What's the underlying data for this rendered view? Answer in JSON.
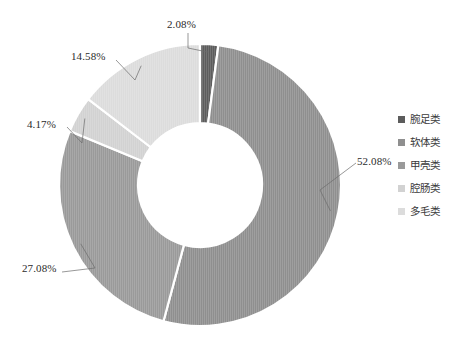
{
  "chart_data": {
    "type": "pie",
    "variant": "donut",
    "title": "",
    "subtitle": "",
    "xlabel": "",
    "ylabel": "",
    "legend_position": "right",
    "grid": false,
    "units": "%",
    "start_angle_deg": 0,
    "direction": "clockwise",
    "inner_radius_ratio": 0.44,
    "categories": [
      "腕足类",
      "软体类",
      "甲壳类",
      "腔肠类",
      "多毛类"
    ],
    "values": [
      2.08,
      52.08,
      27.08,
      4.17,
      14.58
    ],
    "data_labels": [
      "2.08%",
      "52.08%",
      "27.08%",
      "4.17%",
      "14.58%"
    ],
    "colors": [
      "#5c5c5c",
      "#8f8f8f",
      "#9a9a9a",
      "#d2d2d2",
      "#dcdcdc"
    ],
    "slices": [
      {
        "label": "腕足类",
        "value": 2.08,
        "data_label": "2.08%",
        "color": "#5c5c5c"
      },
      {
        "label": "软体类",
        "value": 52.08,
        "data_label": "52.08%",
        "color": "#8f8f8f"
      },
      {
        "label": "甲壳类",
        "value": 27.08,
        "data_label": "27.08%",
        "color": "#9a9a9a"
      },
      {
        "label": "腔肠类",
        "value": 4.17,
        "data_label": "4.17%",
        "color": "#d2d2d2"
      },
      {
        "label": "多毛类",
        "value": 14.58,
        "data_label": "14.58%",
        "color": "#dcdcdc"
      }
    ]
  },
  "labels": {
    "l0": "2.08%",
    "l1": "52.08%",
    "l2": "27.08%",
    "l3": "4.17%",
    "l4": "14.58%"
  },
  "legend": {
    "items": [
      {
        "label": "腕足类",
        "color": "#5c5c5c"
      },
      {
        "label": "软体类",
        "color": "#8f8f8f"
      },
      {
        "label": "甲壳类",
        "color": "#9a9a9a"
      },
      {
        "label": "腔肠类",
        "color": "#d2d2d2"
      },
      {
        "label": "多毛类",
        "color": "#dcdcdc"
      }
    ]
  }
}
